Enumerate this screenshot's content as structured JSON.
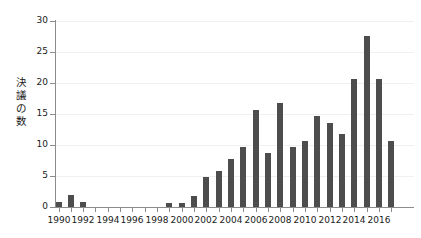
{
  "chart_data": {
    "type": "bar",
    "title": "",
    "xlabel": "",
    "ylabel": "決議の数",
    "ylim": [
      0,
      30
    ],
    "yticks": [
      0,
      5,
      10,
      15,
      20,
      25,
      30
    ],
    "xticks_labeled": [
      1990,
      1992,
      1994,
      1996,
      1998,
      2000,
      2002,
      2004,
      2006,
      2008,
      2010,
      2012,
      2014,
      2016
    ],
    "grid": true,
    "legend": null,
    "bar_color": "#4d4d4d",
    "axis_color": "#8c8c8c",
    "categories": [
      "1990",
      "1991",
      "1992",
      "1993",
      "1994",
      "1995",
      "1996",
      "1997",
      "1998",
      "1999",
      "2000",
      "2001",
      "2002",
      "2003",
      "2004",
      "2005",
      "2006",
      "2007",
      "2008",
      "2009",
      "2010",
      "2011",
      "2012",
      "2013",
      "2014",
      "2015",
      "2016",
      "2017"
    ],
    "values": [
      0.8,
      1.9,
      0.8,
      0,
      0,
      0,
      0,
      0,
      0,
      0.7,
      0.7,
      1.7,
      4.8,
      5.8,
      7.7,
      9.7,
      15.7,
      8.7,
      16.7,
      9.7,
      10.6,
      14.7,
      13.6,
      11.7,
      20.6,
      27.6,
      20.6,
      10.6
    ]
  },
  "axis": {
    "y_title_chars": [
      "決",
      "議",
      "の",
      "数"
    ]
  }
}
